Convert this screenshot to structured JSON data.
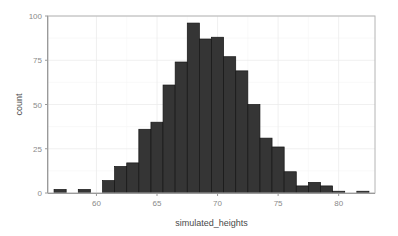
{
  "chart_data": {
    "type": "bar",
    "subtype": "histogram",
    "title": "",
    "xlabel": "simulated_heights",
    "ylabel": "count",
    "xlim": [
      56.0,
      83.0
    ],
    "ylim": [
      0,
      100
    ],
    "xticks": [
      60,
      65,
      70,
      75,
      80
    ],
    "yticks": [
      0,
      25,
      50,
      75,
      100
    ],
    "xtick_labels": [
      "60",
      "65",
      "70",
      "75",
      "80"
    ],
    "ytick_labels": [
      "0",
      "25",
      "50",
      "75",
      "100"
    ],
    "grid": true,
    "legend": "none",
    "binwidth": 1.0,
    "bin_edges": [
      56.5,
      57.5,
      58.5,
      59.5,
      60.5,
      61.5,
      62.5,
      63.5,
      64.5,
      65.5,
      66.5,
      67.5,
      68.5,
      69.5,
      70.5,
      71.5,
      72.5,
      73.5,
      74.5,
      75.5,
      76.5,
      77.5,
      78.5,
      79.5,
      80.5,
      81.5,
      82.5
    ],
    "bin_centers": [
      57,
      58,
      59,
      60,
      61,
      62,
      63,
      64,
      65,
      66,
      67,
      68,
      69,
      70,
      71,
      72,
      73,
      74,
      75,
      76,
      77,
      78,
      79,
      80,
      81,
      82
    ],
    "categories": [
      "57",
      "58",
      "59",
      "60",
      "61",
      "62",
      "63",
      "64",
      "65",
      "66",
      "67",
      "68",
      "69",
      "70",
      "71",
      "72",
      "73",
      "74",
      "75",
      "76",
      "77",
      "78",
      "79",
      "80",
      "81",
      "82"
    ],
    "values": [
      2,
      0,
      2,
      0,
      7,
      15,
      17,
      36,
      40,
      61,
      74,
      96,
      87,
      88,
      77,
      69,
      50,
      31,
      26,
      12,
      4,
      6,
      4,
      1,
      0,
      1
    ],
    "colors": {
      "bar_fill": "#353535",
      "bar_stroke": "#141414",
      "panel_background": "#ffffff",
      "grid_major": "#ececec",
      "grid_minor": "#f5f5f5",
      "panel_border": "#b4b4b4",
      "axis": "#9a9a9a",
      "tick_label": "#8a8a8a",
      "axis_title": "#4a4a4a",
      "figure_background": "#ffffff"
    }
  }
}
